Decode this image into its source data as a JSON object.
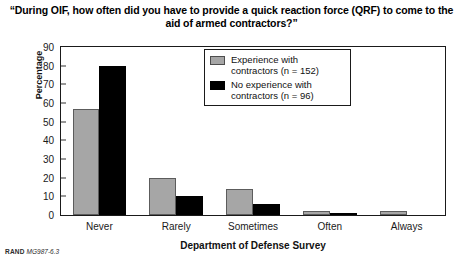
{
  "title": "“During OIF, how often did you have to provide a quick reaction force (QRF) to come to the aid of armed contractors?”",
  "footer": {
    "brand": "RAND",
    "code": "MG987-6.3"
  },
  "legend": {
    "entries": [
      {
        "label": "Experience with contractors (n = 152)",
        "color": "#a6a6a6",
        "swatch": "gray"
      },
      {
        "label": "No experience with contractors (n = 96)",
        "color": "#000000",
        "swatch": "black"
      }
    ]
  },
  "chart_data": {
    "type": "bar",
    "title": "“During OIF, how often did you have to provide a quick reaction force (QRF) to come to the aid of armed contractors?”",
    "xlabel": "Department of Defense Survey",
    "ylabel": "Percentage",
    "categories": [
      "Never",
      "Rarely",
      "Sometimes",
      "Often",
      "Always"
    ],
    "series": [
      {
        "name": "Experience with contractors (n = 152)",
        "color": "#a6a6a6",
        "values": [
          57,
          20,
          14,
          2,
          2
        ]
      },
      {
        "name": "No experience with contractors (n = 96)",
        "color": "#000000",
        "values": [
          80,
          10,
          6,
          1,
          0
        ]
      }
    ],
    "ylim": [
      0,
      90
    ],
    "yticks": [
      0,
      10,
      20,
      30,
      40,
      50,
      60,
      70,
      80,
      90
    ],
    "grid": false,
    "legend_position": "top-center"
  }
}
